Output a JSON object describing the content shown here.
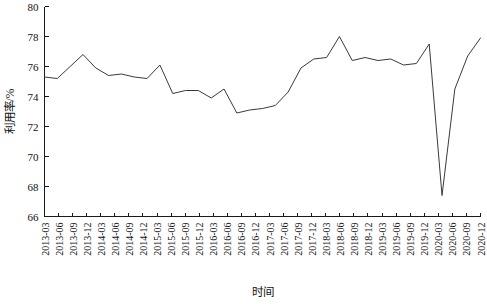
{
  "chart_data": {
    "type": "line",
    "title": "",
    "xlabel": "时间",
    "ylabel": "利用率/%",
    "ylim": [
      66,
      80
    ],
    "yticks": [
      66,
      68,
      70,
      72,
      74,
      76,
      78,
      80
    ],
    "grid": false,
    "legend": "none",
    "categories": [
      "2013-03",
      "2013-06",
      "2013-09",
      "2013-12",
      "2014-03",
      "2014-06",
      "2014-09",
      "2014-12",
      "2015-03",
      "2015-06",
      "2015-09",
      "2015-12",
      "2016-03",
      "2016-06",
      "2016-09",
      "2016-12",
      "2017-03",
      "2017-06",
      "2017-09",
      "2017-12",
      "2018-03",
      "2018-06",
      "2018-09",
      "2018-12",
      "2019-03",
      "2019-06",
      "2019-09",
      "2019-12",
      "2020-03",
      "2020-06",
      "2020-09",
      "2020-12"
    ],
    "series": [
      {
        "name": "利用率",
        "values": [
          75.3,
          75.2,
          76.0,
          76.8,
          75.9,
          75.4,
          75.5,
          75.3,
          75.2,
          76.1,
          74.2,
          74.4,
          74.4,
          73.9,
          74.5,
          72.9,
          73.1,
          73.2,
          73.4,
          74.3,
          75.9,
          76.5,
          76.6,
          78.0,
          76.4,
          76.6,
          76.4,
          76.5,
          76.1,
          76.2,
          77.5,
          67.4
        ]
      }
    ],
    "values_plotted": [
      75.3,
      75.2,
      76.0,
      76.8,
      75.9,
      75.4,
      75.5,
      75.3,
      75.2,
      76.1,
      74.2,
      74.4,
      74.4,
      73.9,
      74.5,
      72.9,
      73.1,
      73.2,
      73.4,
      74.3,
      75.9,
      76.5,
      76.6,
      78.0,
      76.4,
      76.6,
      76.4,
      76.5,
      76.1,
      76.2,
      77.5,
      67.4,
      74.5,
      76.7,
      77.9
    ],
    "notable_points": {
      "first_peak": {
        "x": "2013-12",
        "y": 76.8
      },
      "mid_trough": {
        "x": "2016-03",
        "y": 72.9
      },
      "max_peak": {
        "x": "2017-12",
        "y": 78.0
      },
      "crash_low": {
        "x": "2020-03",
        "y": 67.4
      },
      "final_value": {
        "x": "2020-12",
        "y": 77.9
      }
    }
  },
  "axes": {
    "y_axis_title": "利用率/%",
    "x_axis_title": "时间",
    "y_tick_labels": [
      "66",
      "68",
      "70",
      "72",
      "74",
      "76",
      "78",
      "80"
    ],
    "x_tick_labels": [
      "2013-03",
      "2013-06",
      "2013-09",
      "2013-12",
      "2014-03",
      "2014-06",
      "2014-09",
      "2014-12",
      "2015-03",
      "2015-06",
      "2015-09",
      "2015-12",
      "2016-03",
      "2016-06",
      "2016-09",
      "2016-12",
      "2017-03",
      "2017-06",
      "2017-09",
      "2017-12",
      "2018-03",
      "2018-06",
      "2018-09",
      "2018-12",
      "2019-03",
      "2019-06",
      "2019-09",
      "2019-12",
      "2020-03",
      "2020-06",
      "2020-09",
      "2020-12"
    ]
  },
  "style": {
    "line_color": "#3a3a3a",
    "axis_color": "#1a1a1a",
    "background": "#ffffff"
  }
}
